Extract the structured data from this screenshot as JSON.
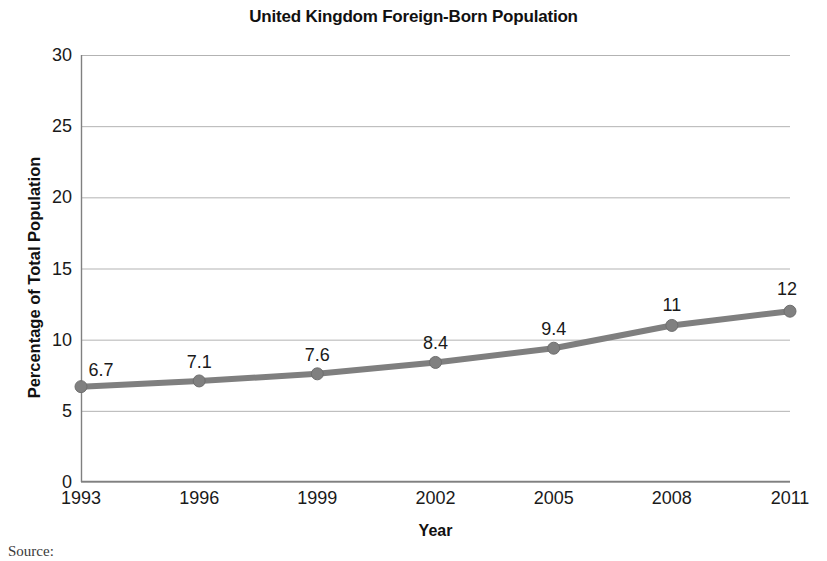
{
  "chart_data": {
    "type": "line",
    "title": "United Kingdom Foreign-Born Population",
    "xlabel": "Year",
    "ylabel": "Percentage of Total Population",
    "categories": [
      "1993",
      "1996",
      "1999",
      "2002",
      "2005",
      "2008",
      "2011"
    ],
    "values": [
      6.7,
      7.1,
      7.6,
      8.4,
      9.4,
      11,
      12
    ],
    "point_labels": [
      "6.7",
      "7.1",
      "7.6",
      "8.4",
      "9.4",
      "11",
      "12"
    ],
    "ylim": [
      0,
      30
    ],
    "y_ticks": [
      0,
      5,
      10,
      15,
      20,
      25,
      30
    ],
    "y_tick_labels": [
      "0",
      "5",
      "10",
      "15",
      "20",
      "25",
      "30"
    ],
    "grid": "horizontal",
    "legend": "none",
    "series": [
      {
        "name": "Foreign-Born Population",
        "values": [
          6.7,
          7.1,
          7.6,
          8.4,
          9.4,
          11,
          12
        ]
      }
    ],
    "colors": {
      "line": "#7f7f7f",
      "marker": "#808080",
      "marker_edge": "#6e6e6e",
      "grid": "#b3b3b3",
      "axis": "#808080",
      "text": "#1a1a1a"
    },
    "line_width_px": 6,
    "marker_radius_px": 6
  },
  "footer": {
    "source_caption": "Source:"
  }
}
